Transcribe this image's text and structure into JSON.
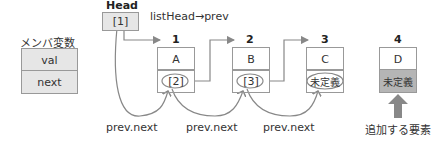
{
  "member_vars": {
    "title": "メンバ変数",
    "fields": [
      "val",
      "next"
    ]
  },
  "head": {
    "label": "Head",
    "value": "[1]",
    "annotation": "listHead→prev"
  },
  "nodes": [
    {
      "index": "1",
      "val": "A",
      "next": "[2]"
    },
    {
      "index": "2",
      "val": "B",
      "next": "[3]"
    },
    {
      "index": "3",
      "val": "C",
      "next": "未定義"
    },
    {
      "index": "4",
      "val": "D",
      "next": "未定義"
    }
  ],
  "arrow_labels": [
    "prev.next",
    "prev.next",
    "prev.next"
  ],
  "new_element_label": "追加する要素",
  "colors": {
    "border": "#999999",
    "field_bg": "#e6e6e6",
    "new_next_bg": "#b5b5b5",
    "arrow": "#888888"
  }
}
